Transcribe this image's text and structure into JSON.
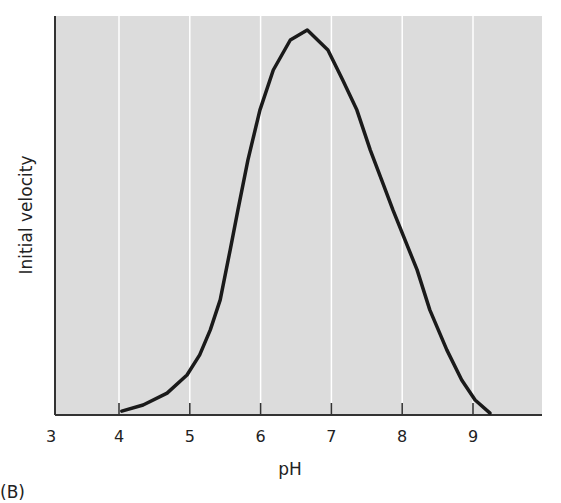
{
  "chart_data": {
    "type": "line",
    "title": "",
    "panel_label": "(B)",
    "xlabel": "pH",
    "ylabel": "Initial velocity",
    "xlim": [
      3,
      10
    ],
    "ylim": [
      0,
      104
    ],
    "x_ticks": [
      3,
      4,
      5,
      6,
      7,
      8,
      9
    ],
    "y_ticks": [],
    "grid": {
      "vertical": true,
      "horizontal": false,
      "color": "#ffffff"
    },
    "background_color": "#dcdcdc",
    "line_color": "#1a1a1a",
    "series": [
      {
        "name": "Initial velocity vs pH",
        "x": [
          4.04,
          4.34,
          4.68,
          4.96,
          5.14,
          5.29,
          5.43,
          5.57,
          5.68,
          5.82,
          5.99,
          6.18,
          6.42,
          6.66,
          6.95,
          7.16,
          7.36,
          7.55,
          7.71,
          7.87,
          8.21,
          8.39,
          8.63,
          8.84,
          9.03,
          9.24
        ],
        "y": [
          1.0,
          2.6,
          5.7,
          10.4,
          15.6,
          22.1,
          29.9,
          42.9,
          53.2,
          66.2,
          79.2,
          89.6,
          97.4,
          100,
          94.8,
          87.0,
          79.2,
          68.8,
          61.0,
          53.2,
          37.7,
          27.3,
          16.9,
          9.1,
          3.9,
          0.5
        ]
      }
    ],
    "legend": null,
    "annotations": [
      "(B)"
    ]
  }
}
